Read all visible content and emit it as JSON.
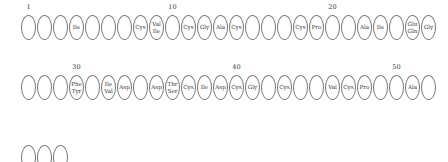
{
  "rows": [
    {
      "start": 1,
      "residues": [
        "",
        "",
        "",
        "Ile",
        "",
        "",
        "",
        "Cys",
        "Val/Ile",
        "",
        "Cys",
        "Gly",
        "Ala",
        "Cys",
        "",
        "",
        "",
        "Cys",
        "Pro",
        "",
        "",
        "Ala",
        "Ile",
        "",
        "Glu/Gln",
        "Gly"
      ],
      "markers": [
        {
          "pos": 1,
          "label": "1"
        },
        {
          "pos": 10,
          "label": "10"
        },
        {
          "pos": 20,
          "label": "20"
        }
      ]
    },
    {
      "start": 27,
      "residues": [
        "",
        "",
        "",
        "Phe/Tyr",
        "",
        "Ile/Val",
        "Asp",
        "",
        "Asp",
        "Thr/Ser",
        "Cys",
        "Ile",
        "Asp",
        "Cys",
        "Gly",
        "",
        "Cys",
        "",
        "",
        "Val",
        "Cys",
        "Pro",
        "",
        "",
        "Ala",
        ""
      ],
      "markers": [
        {
          "pos": 30,
          "label": "30"
        },
        {
          "pos": 40,
          "label": "40"
        },
        {
          "pos": 50,
          "label": "50"
        }
      ]
    },
    {
      "start": 53,
      "residues": [
        "",
        "",
        ""
      ],
      "markers": []
    }
  ]
}
